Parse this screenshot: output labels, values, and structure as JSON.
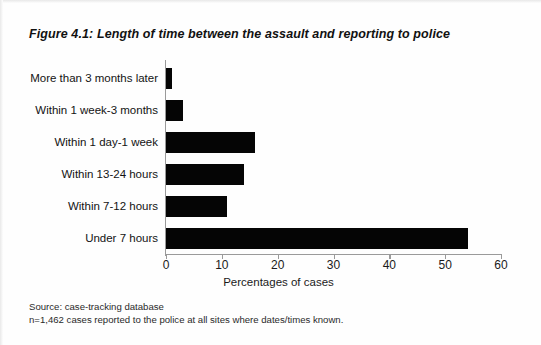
{
  "figure": {
    "number": "Figure 4.1:",
    "title": "Length of time between the assault and reporting to police"
  },
  "footnote": {
    "line1": "Source: case-tracking database",
    "line2": "n=1,462 cases reported to the police at all sites where dates/times known."
  },
  "chart_data": {
    "type": "bar",
    "orientation": "horizontal",
    "title": "Length of time between the assault and reporting to police",
    "xlabel": "Percentages of cases",
    "ylabel": "",
    "xlim": [
      0,
      60
    ],
    "xticks": [
      0,
      10,
      20,
      30,
      40,
      50,
      60
    ],
    "grid": false,
    "legend": null,
    "bar_color": "#050505",
    "axis_color": "#9a9a9a",
    "categories": [
      "More than 3 months later",
      "Within 1 week-3 months",
      "Within 1 day-1 week",
      "Within 13-24 hours",
      "Within 7-12 hours",
      "Under 7 hours"
    ],
    "values": [
      1,
      3,
      16,
      14,
      11,
      54
    ]
  }
}
